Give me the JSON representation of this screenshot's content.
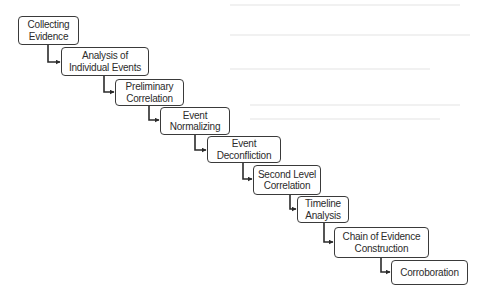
{
  "diagram": {
    "type": "process-flow-staircase",
    "colors": {
      "border": "#3a3a3a",
      "text": "#2b2b2b",
      "connector": "#2b2b2b",
      "background": "#ffffff"
    },
    "steps": [
      {
        "label": "Collecting\nEvidence"
      },
      {
        "label": "Analysis of\nIndividual Events"
      },
      {
        "label": "Preliminary\nCorrelation"
      },
      {
        "label": "Event\nNormalizing"
      },
      {
        "label": "Event\nDeconfliction"
      },
      {
        "label": "Second Level\nCorrelation"
      },
      {
        "label": "Timeline\nAnalysis"
      },
      {
        "label": "Chain of Evidence\nConstruction"
      },
      {
        "label": "Corroboration"
      }
    ]
  }
}
